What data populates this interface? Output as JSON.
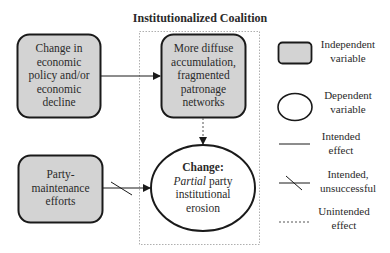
{
  "title": "Institutionalized Coalition",
  "nodes": {
    "economic_change": {
      "type": "independent",
      "lines": [
        "Change in",
        "economic",
        "policy and/or",
        "economic",
        "decline"
      ]
    },
    "diffuse_accumulation": {
      "type": "independent",
      "lines": [
        "More diffuse",
        "accumulation,",
        "fragmented",
        "patronage",
        "networks"
      ]
    },
    "party_maintenance": {
      "type": "independent",
      "lines": [
        "Party-",
        "maintenance",
        "efforts"
      ]
    },
    "outcome": {
      "type": "dependent",
      "heading": "Change:",
      "emph": "Partial",
      "rest_line1": " party",
      "lines": [
        "institutional",
        "erosion"
      ]
    }
  },
  "edges": [
    {
      "from": "economic_change",
      "to": "diffuse_accumulation",
      "style": "intended"
    },
    {
      "from": "diffuse_accumulation",
      "to": "outcome",
      "style": "unintended"
    },
    {
      "from": "party_maintenance",
      "to": "outcome",
      "style": "intended-unsuccessful"
    }
  ],
  "legend": {
    "independent": [
      "Independent",
      "variable"
    ],
    "dependent": [
      "Dependent",
      "variable"
    ],
    "intended": [
      "Intended",
      "effect"
    ],
    "unsuccessful": [
      "Intended,",
      "unsuccessful"
    ],
    "unintended": [
      "Unintended",
      "effect"
    ]
  },
  "colors": {
    "box_fill": "#d3d3d3",
    "stroke": "#1a1a1a",
    "dash": "#8a8a8a"
  }
}
